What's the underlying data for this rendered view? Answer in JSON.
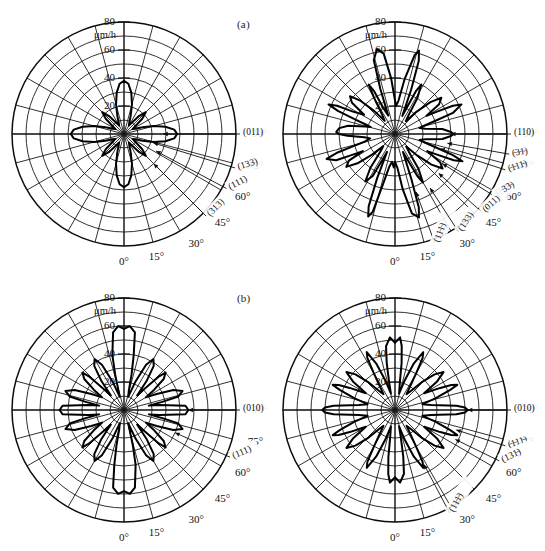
{
  "figure": {
    "panel_labels": [
      {
        "id": "a",
        "text": "(a)"
      },
      {
        "id": "b",
        "text": "(b)"
      }
    ]
  },
  "axes": {
    "radial_unit": "μm/h",
    "radial_ticks": [
      20,
      40,
      60,
      80
    ],
    "radial_tick_labels": [
      "20",
      "40",
      "60",
      "80"
    ],
    "radial_max": 80,
    "angle_ticks": [
      0,
      15,
      30,
      45,
      60,
      75,
      90
    ],
    "angle_tick_labels": [
      "0°",
      "15°",
      "30°",
      "45°",
      "60°",
      "75°",
      "90°"
    ],
    "angular_spoke_step_deg": 15,
    "grid": "on"
  },
  "chart_data": [
    {
      "id": "a-left",
      "type": "line",
      "subplot": "(a)",
      "position": "top-left",
      "title": "",
      "xlabel": "",
      "ylabel": "μm/h",
      "rlim": [
        0,
        80
      ],
      "theta_unit": "degrees",
      "radial_unit": "μm/h",
      "angle_tick_labels": [
        "0°",
        "15°",
        "30°",
        "45°",
        "60°",
        "75°",
        "90°"
      ],
      "radial_tick_labels": [
        "20",
        "40",
        "60",
        "80"
      ],
      "symmetry_fold": 4,
      "theta": [
        0,
        5,
        10,
        15,
        20,
        25,
        30,
        35,
        40,
        45,
        50,
        55,
        60,
        65,
        70,
        75,
        80,
        85,
        90,
        95,
        100,
        105,
        110,
        115,
        120,
        125,
        130,
        135,
        140,
        145,
        150,
        155,
        160,
        165,
        170,
        175,
        180,
        185,
        190,
        195,
        200,
        205,
        210,
        215,
        220,
        225,
        230,
        235,
        240,
        245,
        250,
        255,
        260,
        265,
        270,
        275,
        280,
        285,
        290,
        295,
        300,
        305,
        310,
        315,
        320,
        325,
        330,
        335,
        340,
        345,
        350,
        355
      ],
      "r": [
        38,
        36,
        30,
        22,
        14,
        9,
        7,
        10,
        17,
        22,
        17,
        10,
        7,
        9,
        14,
        22,
        30,
        36,
        38,
        36,
        30,
        22,
        14,
        9,
        7,
        10,
        17,
        22,
        17,
        10,
        7,
        9,
        14,
        22,
        30,
        36,
        38,
        36,
        30,
        22,
        14,
        9,
        7,
        10,
        17,
        22,
        17,
        10,
        7,
        9,
        14,
        22,
        30,
        36,
        38,
        36,
        30,
        22,
        14,
        9,
        7,
        10,
        17,
        22,
        17,
        10,
        7,
        9,
        14,
        22,
        30,
        36
      ],
      "peak_value": 38,
      "min_value": 7,
      "annotations": [
        {
          "text": "(011)",
          "theta_deg": 90,
          "r": 28
        },
        {
          "text": "(133)",
          "theta_deg": 73,
          "r": 22
        },
        {
          "text": "(111)",
          "theta_deg": 62,
          "r": 26
        },
        {
          "text": "(313)",
          "theta_deg": 45,
          "r": 30
        }
      ]
    },
    {
      "id": "a-right",
      "type": "line",
      "subplot": "(a)",
      "position": "top-right",
      "title": "",
      "xlabel": "",
      "ylabel": "μm/h",
      "rlim": [
        0,
        80
      ],
      "theta_unit": "degrees",
      "radial_unit": "μm/h",
      "angle_tick_labels": [
        "0°",
        "15°",
        "30°",
        "45°",
        "60°",
        "75°",
        "90°"
      ],
      "radial_tick_labels": [
        "20",
        "40",
        "60",
        "80"
      ],
      "symmetry_fold": 4,
      "theta": [
        0,
        4,
        8,
        12,
        16,
        18,
        20,
        24,
        26,
        28,
        30,
        34,
        38,
        42,
        46,
        50,
        54,
        58,
        62,
        64,
        66,
        68,
        70,
        72,
        74,
        76,
        80,
        84,
        88,
        90,
        92,
        96,
        100,
        104,
        106,
        108,
        110,
        114,
        116,
        118,
        120,
        124,
        128,
        132,
        136,
        140,
        144,
        148,
        152,
        154,
        156,
        158,
        160,
        162,
        164,
        166,
        170,
        174,
        178,
        180,
        184,
        188,
        192,
        196,
        198,
        200,
        204,
        206,
        208,
        210,
        214,
        218,
        222,
        226,
        230,
        234,
        238,
        242,
        244,
        246,
        248,
        250,
        252,
        254,
        256,
        260,
        264,
        268,
        270,
        272,
        276,
        280,
        284,
        286,
        288,
        290,
        294,
        296,
        298,
        300,
        304,
        308,
        312,
        316,
        320,
        324,
        328,
        332,
        334,
        336,
        338,
        340,
        342,
        344,
        346,
        350,
        354,
        358
      ],
      "r": [
        20,
        24,
        40,
        58,
        62,
        55,
        34,
        14,
        20,
        34,
        40,
        30,
        16,
        12,
        22,
        34,
        42,
        38,
        26,
        34,
        46,
        52,
        44,
        30,
        22,
        18,
        22,
        34,
        40,
        42,
        40,
        34,
        22,
        18,
        22,
        30,
        44,
        52,
        46,
        34,
        26,
        38,
        42,
        34,
        22,
        12,
        16,
        30,
        40,
        34,
        20,
        14,
        34,
        55,
        62,
        58,
        40,
        24,
        20,
        24,
        40,
        58,
        62,
        55,
        34,
        14,
        20,
        34,
        40,
        30,
        16,
        12,
        22,
        34,
        42,
        38,
        26,
        34,
        46,
        52,
        44,
        30,
        22,
        18,
        22,
        34,
        40,
        42,
        40,
        34,
        22,
        18,
        22,
        30,
        44,
        52,
        46,
        34,
        26,
        38,
        42,
        34,
        22,
        12,
        16,
        30,
        40,
        34,
        20,
        14,
        34,
        55,
        62,
        58,
        40,
        24,
        20,
        24
      ],
      "peak_value": 62,
      "min_value": 12,
      "annotations": [
        {
          "text": "(110)",
          "theta_deg": 90,
          "r": 40
        },
        {
          "text": "(̵3̵1̵)",
          "theta_deg": 80,
          "r": 38
        },
        {
          "text": "(̵1̵11̵)",
          "theta_deg": 72,
          "r": 34
        },
        {
          "text": "(̵1̵33̵)",
          "theta_deg": 58,
          "r": 40
        },
        {
          "text": "(011)",
          "theta_deg": 48,
          "r": 42
        },
        {
          "text": "(11̵1̵)",
          "theta_deg": 20,
          "r": 44
        },
        {
          "text": "(133)",
          "theta_deg": 33,
          "r": 46
        }
      ]
    },
    {
      "id": "b-left",
      "type": "line",
      "subplot": "(b)",
      "position": "bottom-left",
      "title": "",
      "xlabel": "",
      "ylabel": "μm/h",
      "rlim": [
        0,
        80
      ],
      "theta_unit": "degrees",
      "radial_unit": "μm/h",
      "angle_tick_labels": [
        "0°",
        "15°",
        "30°",
        "45°",
        "60°",
        "75°",
        "90°"
      ],
      "radial_tick_labels": [
        "20",
        "40",
        "60",
        "80"
      ],
      "symmetry_fold": 4,
      "theta": [
        0,
        4,
        8,
        12,
        14,
        16,
        18,
        22,
        26,
        30,
        34,
        38,
        42,
        44,
        46,
        48,
        52,
        56,
        60,
        64,
        68,
        72,
        76,
        78,
        80,
        82,
        86,
        90,
        94,
        98,
        100,
        102,
        104,
        108,
        112,
        116,
        120,
        124,
        128,
        132,
        134,
        136,
        138,
        142,
        146,
        150,
        154,
        158,
        162,
        166,
        168,
        170,
        172,
        176,
        180,
        184,
        188,
        192,
        194,
        196,
        198,
        202,
        206,
        210,
        214,
        218,
        222,
        224,
        226,
        228,
        232,
        236,
        240,
        244,
        248,
        252,
        256,
        258,
        260,
        262,
        266,
        270,
        274,
        278,
        280,
        282,
        284,
        288,
        292,
        296,
        300,
        304,
        308,
        312,
        314,
        316,
        318,
        322,
        326,
        330,
        334,
        338,
        342,
        346,
        348,
        350,
        352,
        356
      ],
      "r": [
        58,
        60,
        56,
        40,
        26,
        14,
        10,
        22,
        36,
        42,
        38,
        26,
        14,
        20,
        34,
        40,
        36,
        26,
        18,
        26,
        38,
        44,
        40,
        28,
        18,
        26,
        44,
        46,
        44,
        26,
        18,
        28,
        40,
        44,
        38,
        26,
        18,
        26,
        36,
        40,
        34,
        20,
        14,
        26,
        38,
        42,
        36,
        22,
        10,
        14,
        26,
        40,
        56,
        60,
        58,
        60,
        56,
        40,
        26,
        14,
        10,
        22,
        36,
        42,
        38,
        26,
        14,
        20,
        34,
        40,
        36,
        26,
        18,
        26,
        38,
        44,
        40,
        28,
        18,
        26,
        44,
        46,
        44,
        26,
        18,
        28,
        40,
        44,
        38,
        26,
        18,
        26,
        36,
        40,
        34,
        20,
        14,
        26,
        38,
        42,
        36,
        22,
        10,
        14,
        26,
        40,
        56,
        60
      ],
      "peak_value": 60,
      "min_value": 10,
      "annotations": [
        {
          "text": "(010)",
          "theta_deg": 90,
          "r": 46
        },
        {
          "text": "(111)",
          "theta_deg": 66,
          "r": 40
        }
      ]
    },
    {
      "id": "b-right",
      "type": "line",
      "subplot": "(b)",
      "position": "bottom-right",
      "title": "",
      "xlabel": "",
      "ylabel": "μm/h",
      "rlim": [
        0,
        80
      ],
      "theta_unit": "degrees",
      "radial_unit": "μm/h",
      "angle_tick_labels": [
        "0°",
        "15°",
        "30°",
        "45°",
        "60°",
        "75°",
        "90°"
      ],
      "radial_tick_labels": [
        "20",
        "40",
        "60",
        "80"
      ],
      "symmetry_fold": 4,
      "theta": [
        0,
        4,
        8,
        10,
        12,
        14,
        18,
        22,
        26,
        28,
        30,
        32,
        36,
        40,
        44,
        48,
        52,
        56,
        60,
        64,
        66,
        68,
        70,
        74,
        78,
        82,
        86,
        88,
        90,
        92,
        94,
        98,
        102,
        106,
        110,
        112,
        114,
        116,
        120,
        124,
        128,
        132,
        136,
        140,
        144,
        148,
        150,
        152,
        154,
        158,
        162,
        166,
        170,
        172,
        174,
        176,
        180,
        184,
        188,
        190,
        192,
        194,
        198,
        202,
        206,
        208,
        210,
        212,
        216,
        220,
        224,
        228,
        232,
        236,
        240,
        244,
        246,
        248,
        250,
        254,
        258,
        262,
        266,
        268,
        270,
        272,
        274,
        278,
        282,
        286,
        290,
        292,
        294,
        296,
        300,
        304,
        308,
        312,
        316,
        320,
        324,
        328,
        330,
        332,
        334,
        338,
        342,
        346,
        350,
        352,
        354,
        356
      ],
      "r": [
        48,
        52,
        46,
        34,
        20,
        12,
        22,
        36,
        46,
        42,
        30,
        22,
        14,
        18,
        28,
        38,
        44,
        36,
        24,
        36,
        44,
        48,
        42,
        30,
        20,
        26,
        44,
        50,
        52,
        50,
        44,
        26,
        20,
        30,
        42,
        48,
        44,
        36,
        24,
        36,
        44,
        38,
        28,
        18,
        14,
        22,
        30,
        42,
        46,
        36,
        22,
        12,
        20,
        34,
        46,
        52,
        48,
        52,
        46,
        34,
        20,
        12,
        22,
        36,
        46,
        42,
        30,
        22,
        14,
        18,
        28,
        38,
        44,
        36,
        24,
        36,
        44,
        48,
        42,
        30,
        20,
        26,
        44,
        50,
        52,
        50,
        44,
        26,
        20,
        30,
        42,
        48,
        44,
        36,
        24,
        36,
        44,
        38,
        28,
        18,
        14,
        22,
        30,
        42,
        46,
        36,
        22,
        12,
        20,
        34,
        46,
        52
      ],
      "peak_value": 52,
      "min_value": 12,
      "annotations": [
        {
          "text": "(010)",
          "theta_deg": 90,
          "r": 52
        },
        {
          "text": "(̵1̵11̵)",
          "theta_deg": 72,
          "r": 46
        },
        {
          "text": "(131̵)",
          "theta_deg": 64,
          "r": 48
        },
        {
          "text": "(11̵1̵)",
          "theta_deg": 28,
          "r": 44
        }
      ]
    }
  ]
}
